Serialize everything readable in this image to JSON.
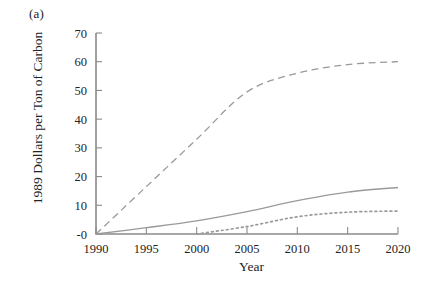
{
  "figure": {
    "panel_label": "(a)",
    "xlabel": "Year",
    "ylabel": "1989 Dollars per Ton of Carbon"
  },
  "chart_data": {
    "type": "line",
    "title": "",
    "panel": "(a)",
    "xlabel": "Year",
    "ylabel": "1989 Dollars per Ton of Carbon",
    "xlim": [
      1990,
      2020
    ],
    "ylim": [
      0,
      70
    ],
    "xticks": [
      1990,
      1995,
      2000,
      2005,
      2010,
      2015,
      2020
    ],
    "xticklabels": [
      "1990",
      "1995",
      "2000",
      "2005",
      "2010",
      "2015",
      "2020"
    ],
    "yticks": [
      0,
      10,
      20,
      30,
      40,
      50,
      60,
      70
    ],
    "yticklabels": [
      "-0",
      "10",
      "20",
      "30",
      "40",
      "50",
      "60",
      "70"
    ],
    "grid": false,
    "legend": "none",
    "series": [
      {
        "name": "dashed-upper",
        "style": "dashed",
        "color": "#9a9a9a",
        "x": [
          1990,
          1995,
          2000,
          2005,
          2010,
          2015,
          2020
        ],
        "values": [
          0,
          16.5,
          33,
          49.5,
          56,
          59,
          60
        ]
      },
      {
        "name": "solid-middle",
        "style": "solid",
        "color": "#9a9a9a",
        "x": [
          1990,
          1995,
          2000,
          2005,
          2010,
          2015,
          2020
        ],
        "values": [
          0,
          2.2,
          4.6,
          7.8,
          11.6,
          14.6,
          16.2
        ]
      },
      {
        "name": "dotted-lower",
        "style": "dotted",
        "color": "#9a9a9a",
        "x": [
          2000,
          2005,
          2010,
          2015,
          2020
        ],
        "values": [
          0,
          2.6,
          6.0,
          7.6,
          8.0
        ]
      }
    ]
  },
  "axes_geometry": {
    "x0": 96,
    "x1": 398,
    "y0": 234,
    "y1": 33
  }
}
